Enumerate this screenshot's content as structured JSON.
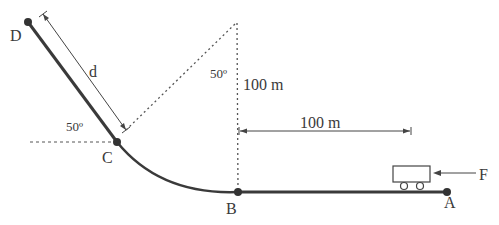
{
  "diagram": {
    "type": "physics-track-diagram",
    "points": [
      {
        "id": "D",
        "label": "D",
        "x": 28,
        "y": 22
      },
      {
        "id": "C",
        "label": "C",
        "x": 117,
        "y": 142
      },
      {
        "id": "B",
        "label": "B",
        "x": 238,
        "y": 192
      },
      {
        "id": "A",
        "label": "A",
        "x": 447,
        "y": 192
      }
    ],
    "labels": {
      "d": "d",
      "angle_at_c": "50º",
      "angle_top": "50º",
      "vertical_distance": "100 m",
      "horizontal_distance": "100 m",
      "force": "F"
    },
    "colors": {
      "track": "#3a3a3a",
      "line": "#444444",
      "background": "#ffffff"
    }
  }
}
